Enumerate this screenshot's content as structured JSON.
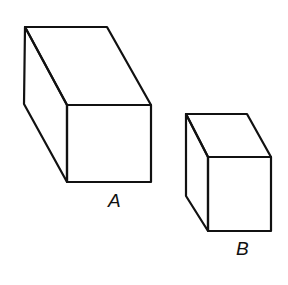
{
  "figure": {
    "boxes": [
      {
        "label": "A",
        "size": "larger",
        "vertices": {
          "back_top_left": [
            25,
            27
          ],
          "back_top_right": [
            107,
            27
          ],
          "back_bottom_left": [
            24,
            104
          ],
          "front_top_left": [
            67,
            105
          ],
          "front_top_right": [
            151,
            105
          ],
          "front_bottom_left": [
            67,
            182
          ],
          "front_bottom_right": [
            151,
            182
          ]
        },
        "label_pos": [
          117,
          207
        ]
      },
      {
        "label": "B",
        "size": "smaller",
        "vertices": {
          "back_top_left": [
            186,
            114
          ],
          "back_top_right": [
            247,
            114
          ],
          "back_bottom_left": [
            186,
            196
          ],
          "front_top_left": [
            208,
            157
          ],
          "front_top_right": [
            271,
            157
          ],
          "front_bottom_left": [
            208,
            231
          ],
          "front_bottom_right": [
            271,
            231
          ]
        },
        "label_pos": [
          244,
          254
        ]
      }
    ],
    "stroke_color": "#111111",
    "background": "#ffffff"
  }
}
